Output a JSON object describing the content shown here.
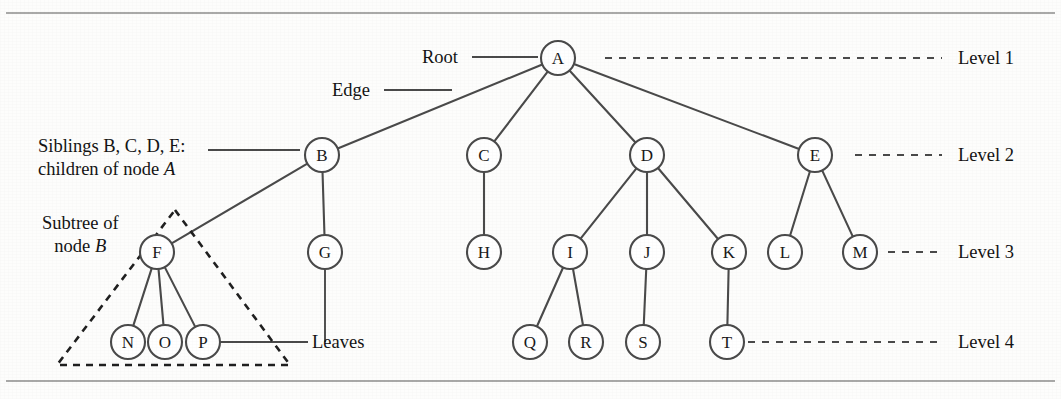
{
  "figure": {
    "kind": "tree-terminology-diagram",
    "stroke_color": "#4a4a4a",
    "text_color": "#141414",
    "background": "#fdfdfc",
    "top_rule_label": "top-horizontal-rule",
    "bottom_rule_label": "bottom-horizontal-rule"
  },
  "nodes": [
    {
      "id": "A",
      "label": "A",
      "cx": 558,
      "cy": 58,
      "r": 17,
      "level": 1
    },
    {
      "id": "B",
      "label": "B",
      "cx": 322,
      "cy": 155,
      "r": 17,
      "level": 2
    },
    {
      "id": "C",
      "label": "C",
      "cx": 484,
      "cy": 155,
      "r": 17,
      "level": 2
    },
    {
      "id": "D",
      "label": "D",
      "cx": 647,
      "cy": 155,
      "r": 17,
      "level": 2
    },
    {
      "id": "E",
      "label": "E",
      "cx": 815,
      "cy": 155,
      "r": 17,
      "level": 2
    },
    {
      "id": "F",
      "label": "F",
      "cx": 157,
      "cy": 252,
      "r": 17,
      "level": 3
    },
    {
      "id": "G",
      "label": "G",
      "cx": 325,
      "cy": 252,
      "r": 17,
      "level": 3
    },
    {
      "id": "H",
      "label": "H",
      "cx": 484,
      "cy": 252,
      "r": 17,
      "level": 3
    },
    {
      "id": "I",
      "label": "I",
      "cx": 570,
      "cy": 252,
      "r": 17,
      "level": 3
    },
    {
      "id": "J",
      "label": "J",
      "cx": 647,
      "cy": 252,
      "r": 17,
      "level": 3
    },
    {
      "id": "K",
      "label": "K",
      "cx": 729,
      "cy": 252,
      "r": 17,
      "level": 3
    },
    {
      "id": "L",
      "label": "L",
      "cx": 785,
      "cy": 252,
      "r": 17,
      "level": 3
    },
    {
      "id": "M",
      "label": "M",
      "cx": 860,
      "cy": 252,
      "r": 17,
      "level": 3
    },
    {
      "id": "N",
      "label": "N",
      "cx": 128,
      "cy": 342,
      "r": 17,
      "level": 4
    },
    {
      "id": "O",
      "label": "O",
      "cx": 165,
      "cy": 342,
      "r": 17,
      "level": 4
    },
    {
      "id": "P",
      "label": "P",
      "cx": 203,
      "cy": 342,
      "r": 17,
      "level": 4
    },
    {
      "id": "Q",
      "label": "Q",
      "cx": 530,
      "cy": 342,
      "r": 17,
      "level": 4
    },
    {
      "id": "R",
      "label": "R",
      "cx": 586,
      "cy": 342,
      "r": 17,
      "level": 4
    },
    {
      "id": "S",
      "label": "S",
      "cx": 643,
      "cy": 342,
      "r": 17,
      "level": 4
    },
    {
      "id": "T",
      "label": "T",
      "cx": 727,
      "cy": 342,
      "r": 17,
      "level": 4
    }
  ],
  "edges": [
    {
      "from": "A",
      "to": "B"
    },
    {
      "from": "A",
      "to": "C"
    },
    {
      "from": "A",
      "to": "D"
    },
    {
      "from": "A",
      "to": "E"
    },
    {
      "from": "B",
      "to": "F"
    },
    {
      "from": "B",
      "to": "G"
    },
    {
      "from": "C",
      "to": "H"
    },
    {
      "from": "D",
      "to": "I"
    },
    {
      "from": "D",
      "to": "J"
    },
    {
      "from": "D",
      "to": "K"
    },
    {
      "from": "E",
      "to": "L"
    },
    {
      "from": "E",
      "to": "M"
    },
    {
      "from": "F",
      "to": "N"
    },
    {
      "from": "F",
      "to": "O"
    },
    {
      "from": "F",
      "to": "P"
    },
    {
      "from": "I",
      "to": "Q"
    },
    {
      "from": "I",
      "to": "R"
    },
    {
      "from": "J",
      "to": "S"
    },
    {
      "from": "K",
      "to": "T"
    }
  ],
  "levels": [
    {
      "label": "Level 1",
      "y": 58,
      "dash_x1": 605,
      "dash_x2": 942,
      "text_x": 958
    },
    {
      "label": "Level 2",
      "y": 155,
      "dash_x1": 855,
      "dash_x2": 942,
      "text_x": 958
    },
    {
      "label": "Level 3",
      "y": 252,
      "dash_x1": 888,
      "dash_x2": 942,
      "text_x": 958
    },
    {
      "label": "Level 4",
      "y": 342,
      "dash_x1": 748,
      "dash_x2": 942,
      "text_x": 958
    }
  ],
  "annotations": {
    "root": {
      "text": "Root",
      "text_x": 458,
      "text_y": 57,
      "leader_x1": 472,
      "leader_x2": 538,
      "leader_y": 57
    },
    "edge": {
      "text": "Edge",
      "text_x": 370,
      "text_y": 90,
      "leader_x1": 384,
      "leader_x2": 452,
      "leader_y": 90
    },
    "siblings": {
      "line1": "Siblings B, C, D, E:",
      "line2_prefix": "children of node ",
      "line2_italic": "A",
      "text_x": 38,
      "line1_y": 146,
      "line2_y": 169,
      "leader_x1": 208,
      "leader_x2": 300,
      "leader_y": 150
    },
    "subtree": {
      "line1": "Subtree of",
      "line2_prefix": "node ",
      "line2_italic": "B",
      "text_x": 42,
      "line1_y": 223,
      "line2_y": 246
    },
    "leaves": {
      "text": "Leaves",
      "text_x": 312,
      "text_y": 342,
      "leader_x1": 220,
      "leader_x2": 308,
      "leader_y": 342,
      "g_drop_x": 325,
      "g_drop_y1": 270,
      "g_drop_y2": 342
    }
  },
  "subtree_triangle": {
    "apex_x": 175,
    "apex_y": 210,
    "left_x": 57,
    "right_x": 290,
    "base_y": 365,
    "dash_pattern": "7,6"
  },
  "rules": [
    {
      "name": "top-rule",
      "y": 13
    },
    {
      "name": "bottom-rule",
      "y": 381
    }
  ]
}
